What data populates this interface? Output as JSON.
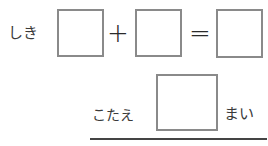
{
  "expression": {
    "label": "しき",
    "operator_plus": "+",
    "operator_equals": "=",
    "boxes": [
      "",
      "",
      ""
    ]
  },
  "answer": {
    "label": "こたえ",
    "value": "",
    "unit": "まい"
  }
}
